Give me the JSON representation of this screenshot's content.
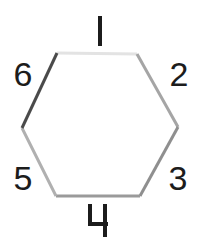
{
  "figure": {
    "name": "hexagon-edge-diagram",
    "background_color": "#ffffff",
    "shape": "hexagon",
    "vertex_count": 6,
    "edge_count": 6,
    "stroke_width": 3
  },
  "hexagon": {
    "vertices": [
      {
        "name": "top-left",
        "x": 57,
        "y": 53
      },
      {
        "name": "top-right",
        "x": 137,
        "y": 54
      },
      {
        "name": "right",
        "x": 178,
        "y": 127
      },
      {
        "name": "bottom-right",
        "x": 140,
        "y": 196
      },
      {
        "name": "bottom-left",
        "x": 56,
        "y": 196
      },
      {
        "name": "left",
        "x": 22,
        "y": 128
      }
    ],
    "edges": [
      {
        "id": "edge-1",
        "label": "1",
        "position": "top",
        "color": "#e3e3e3",
        "from": "top-left",
        "to": "top-right"
      },
      {
        "id": "edge-2",
        "label": "2",
        "position": "upper-right",
        "color": "#a5a5a5",
        "from": "top-right",
        "to": "right"
      },
      {
        "id": "edge-3",
        "label": "3",
        "position": "lower-right",
        "color": "#8f8f8f",
        "from": "right",
        "to": "bottom-right"
      },
      {
        "id": "edge-4",
        "label": "4",
        "position": "bottom",
        "color": "#9a9a9a",
        "from": "bottom-right",
        "to": "bottom-left"
      },
      {
        "id": "edge-5",
        "label": "5",
        "position": "lower-left",
        "color": "#b0b0b0",
        "from": "bottom-left",
        "to": "left"
      },
      {
        "id": "edge-6",
        "label": "6",
        "position": "upper-left",
        "color": "#4a4a4a",
        "from": "left",
        "to": "top-left"
      }
    ]
  },
  "labels": {
    "one": "1",
    "two": "2",
    "three": "3",
    "four": "4",
    "five": "5",
    "six": "6",
    "color": "#1c1c1c"
  }
}
